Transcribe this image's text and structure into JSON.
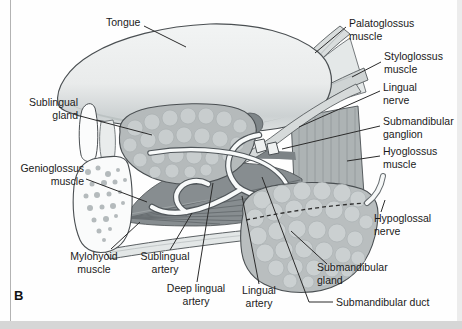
{
  "figure": {
    "panel_letter": "B",
    "type": "anatomical-diagram"
  },
  "labels": {
    "tongue": {
      "lines": [
        "Tongue"
      ]
    },
    "palatoglossus": {
      "lines": [
        "Palatoglossus",
        "muscle"
      ]
    },
    "styloglossus": {
      "lines": [
        "Styloglossus",
        "muscle"
      ]
    },
    "lingual_nerve": {
      "lines": [
        "Lingual",
        "nerve"
      ]
    },
    "submandibular_ganglion": {
      "lines": [
        "Submandibular",
        "ganglion"
      ]
    },
    "hyoglossus": {
      "lines": [
        "Hyoglossus",
        "muscle"
      ]
    },
    "hypoglossal": {
      "lines": [
        "Hypoglossal",
        "nerve"
      ]
    },
    "sublingual_gland": {
      "lines": [
        "Sublingual",
        "gland"
      ]
    },
    "genioglossus": {
      "lines": [
        "Genioglossus",
        "muscle"
      ]
    },
    "mylohyoid": {
      "lines": [
        "Mylohyoid",
        "muscle"
      ]
    },
    "sublingual_artery": {
      "lines": [
        "Sublingual",
        "artery"
      ]
    },
    "deep_lingual_artery": {
      "lines": [
        "Deep lingual",
        "artery"
      ]
    },
    "lingual_artery": {
      "lines": [
        "Lingual",
        "artery"
      ]
    },
    "submandibular_gland": {
      "lines": [
        "Submandibular",
        "gland"
      ]
    },
    "submandibular_duct": {
      "lines": [
        "Submandibular duct"
      ]
    }
  },
  "colors": {
    "outline": "#4a4f52",
    "tongue": "#ebedee",
    "gland": "#b7bcbd",
    "muscle_dark": "#878d90",
    "artery_white": "#f8fafa",
    "background": "#fefefe"
  }
}
